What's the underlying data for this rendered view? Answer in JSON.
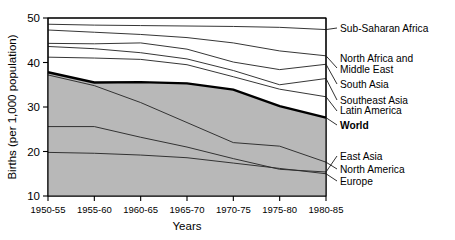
{
  "chart_data": {
    "type": "line",
    "title": "",
    "xlabel": "Years",
    "ylabel": "Births (per 1,000 population)",
    "categories": [
      "1950-55",
      "1955-60",
      "1960-65",
      "1965-70",
      "1970-75",
      "1975-80",
      "1980-85"
    ],
    "ylim": [
      10,
      50
    ],
    "xlim": [
      0,
      6
    ],
    "yticks": [
      10,
      20,
      30,
      40,
      50
    ],
    "grid": false,
    "legend_position": "right-inline",
    "shaded_region": {
      "description": "grey shading below the World line down to the x-axis",
      "color": "#b8b8b8"
    },
    "series": [
      {
        "name": "Sub-Saharan Africa",
        "emphasis": "normal",
        "values": [
          48.6,
          48.4,
          48.3,
          48.2,
          48.1,
          47.9,
          47.4
        ]
      },
      {
        "name": "North Africa and Middle East",
        "emphasis": "normal",
        "values": [
          47.3,
          46.8,
          46.3,
          45.6,
          44.4,
          42.6,
          41.5
        ]
      },
      {
        "name": "South Asia",
        "emphasis": "normal",
        "values": [
          44.3,
          44.2,
          44.4,
          43.0,
          40.1,
          38.4,
          39.6
        ]
      },
      {
        "name": "Southeast Asia",
        "emphasis": "normal",
        "values": [
          43.6,
          43.1,
          42.2,
          40.8,
          38.2,
          35.0,
          36.4
        ]
      },
      {
        "name": "Latin America",
        "emphasis": "normal",
        "values": [
          41.2,
          41.0,
          40.7,
          39.5,
          36.8,
          34.0,
          32.3
        ]
      },
      {
        "name": "World",
        "emphasis": "bold",
        "values": [
          37.8,
          35.5,
          35.6,
          35.3,
          33.9,
          30.2,
          27.6
        ]
      },
      {
        "name": "East Asia",
        "emphasis": "normal",
        "values": [
          25.6,
          25.6,
          23.2,
          21.0,
          18.4,
          16.0,
          15.4
        ]
      },
      {
        "name": "North America",
        "emphasis": "normal",
        "values": [
          37.2,
          34.8,
          31.0,
          26.5,
          22.0,
          21.2,
          17.6
        ]
      },
      {
        "name": "Europe",
        "emphasis": "normal",
        "values": [
          19.8,
          19.6,
          19.2,
          18.6,
          17.4,
          16.2,
          15.0
        ]
      }
    ]
  },
  "axes": {
    "y_title": "Births (per 1,000 population)",
    "x_title": "Years",
    "y_ticks": [
      "50",
      "40",
      "30",
      "20",
      "10"
    ],
    "x_ticks": [
      "1950-55",
      "1955-60",
      "1960-65",
      "1965-70",
      "1970-75",
      "1975-80",
      "1980-85"
    ]
  },
  "labels": {
    "sub_saharan_africa": "Sub-Saharan Africa",
    "north_africa_line1": "North Africa and",
    "north_africa_line2": "Middle East",
    "south_asia": "South Asia",
    "southeast_asia": "Southeast Asia",
    "latin_america": "Latin America",
    "world": "World",
    "east_asia": "East Asia",
    "north_america": "North America",
    "europe": "Europe"
  },
  "colors": {
    "shading": "#b8b8b8",
    "line": "#1a1a1a",
    "background": "#ffffff"
  }
}
